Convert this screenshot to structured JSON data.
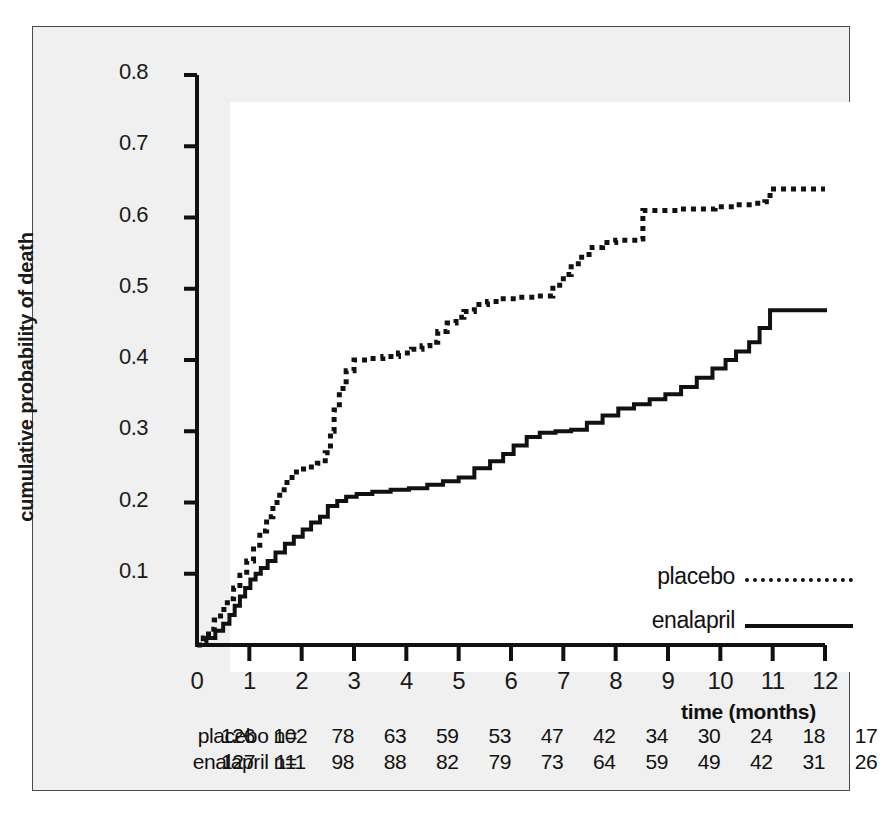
{
  "figure": {
    "background_color": "#f0f0f0",
    "plot_background_color": "#ffffff",
    "border_color": "#4a4a4a",
    "ink_color": "#111111"
  },
  "chart_data": {
    "type": "line",
    "title": "",
    "xlabel": "time (months)",
    "ylabel": "cumulative probability of death",
    "xlim": [
      0,
      12
    ],
    "ylim": [
      0,
      0.8
    ],
    "xticks": [
      0,
      1,
      2,
      3,
      4,
      5,
      6,
      7,
      8,
      9,
      10,
      11,
      12
    ],
    "xtick_labels": [
      "0",
      "1",
      "2",
      "3",
      "4",
      "5",
      "6",
      "7",
      "8",
      "9",
      "10",
      "11",
      "12"
    ],
    "yticks": [
      0.1,
      0.2,
      0.3,
      0.4,
      0.5,
      0.6,
      0.7,
      0.8
    ],
    "ytick_labels": [
      "0.1",
      "0.2",
      "0.3",
      "0.4",
      "0.5",
      "0.6",
      "0.7",
      "0.8"
    ],
    "grid": false,
    "legend_position": "inside-lower-right",
    "step_type": "post",
    "series": [
      {
        "name": "placebo",
        "linestyle": "dotted",
        "color": "#111111",
        "x": [
          0.0,
          0.12,
          0.22,
          0.33,
          0.45,
          0.58,
          0.7,
          0.82,
          0.95,
          1.08,
          1.2,
          1.33,
          1.45,
          1.58,
          1.72,
          1.9,
          2.1,
          2.3,
          2.45,
          2.55,
          2.62,
          2.72,
          2.85,
          3.0,
          3.25,
          3.55,
          3.85,
          4.1,
          4.3,
          4.45,
          4.6,
          4.78,
          4.95,
          5.1,
          5.3,
          5.55,
          5.8,
          6.1,
          6.5,
          6.8,
          7.0,
          7.15,
          7.35,
          7.55,
          7.75,
          8.0,
          8.45,
          8.52,
          9.2,
          9.9,
          10.3,
          10.6,
          10.85,
          10.95,
          11.3,
          12.0
        ],
        "y": [
          0.0,
          0.01,
          0.022,
          0.035,
          0.05,
          0.065,
          0.08,
          0.098,
          0.118,
          0.14,
          0.16,
          0.18,
          0.2,
          0.218,
          0.235,
          0.247,
          0.25,
          0.255,
          0.27,
          0.3,
          0.33,
          0.36,
          0.385,
          0.4,
          0.402,
          0.405,
          0.41,
          0.415,
          0.42,
          0.425,
          0.44,
          0.452,
          0.46,
          0.468,
          0.478,
          0.482,
          0.486,
          0.488,
          0.49,
          0.505,
          0.52,
          0.535,
          0.548,
          0.558,
          0.565,
          0.568,
          0.57,
          0.61,
          0.612,
          0.615,
          0.618,
          0.62,
          0.622,
          0.64,
          0.64,
          0.64
        ]
      },
      {
        "name": "enalapril",
        "linestyle": "solid",
        "color": "#111111",
        "x": [
          0.0,
          0.18,
          0.35,
          0.5,
          0.62,
          0.72,
          0.82,
          0.92,
          1.02,
          1.12,
          1.22,
          1.35,
          1.5,
          1.68,
          1.85,
          2.02,
          2.18,
          2.35,
          2.5,
          2.68,
          2.85,
          3.05,
          3.35,
          3.7,
          4.05,
          4.4,
          4.7,
          5.0,
          5.3,
          5.6,
          5.85,
          6.05,
          6.3,
          6.55,
          6.85,
          7.15,
          7.45,
          7.75,
          8.05,
          8.35,
          8.65,
          8.95,
          9.25,
          9.55,
          9.85,
          10.1,
          10.3,
          10.55,
          10.75,
          10.95,
          12.0
        ],
        "y": [
          0.0,
          0.01,
          0.02,
          0.03,
          0.042,
          0.055,
          0.068,
          0.08,
          0.092,
          0.1,
          0.108,
          0.118,
          0.13,
          0.142,
          0.152,
          0.162,
          0.172,
          0.18,
          0.195,
          0.202,
          0.208,
          0.212,
          0.215,
          0.218,
          0.22,
          0.225,
          0.23,
          0.235,
          0.248,
          0.258,
          0.268,
          0.28,
          0.292,
          0.298,
          0.3,
          0.302,
          0.312,
          0.322,
          0.332,
          0.338,
          0.345,
          0.352,
          0.362,
          0.375,
          0.388,
          0.4,
          0.412,
          0.425,
          0.445,
          0.47,
          0.47
        ]
      }
    ]
  },
  "legend": {
    "entries": [
      {
        "label": "placebo",
        "style": "dotted"
      },
      {
        "label": "enalapril",
        "style": "solid"
      }
    ]
  },
  "risk_table": {
    "rows": [
      {
        "label": "placebo n=",
        "values": [
          "126",
          "102",
          "78",
          "63",
          "59",
          "53",
          "47",
          "42",
          "34",
          "30",
          "24",
          "18",
          "17"
        ]
      },
      {
        "label": "enalapril n=",
        "values": [
          "127",
          "111",
          "98",
          "88",
          "82",
          "79",
          "73",
          "64",
          "59",
          "49",
          "42",
          "31",
          "26"
        ]
      }
    ]
  }
}
